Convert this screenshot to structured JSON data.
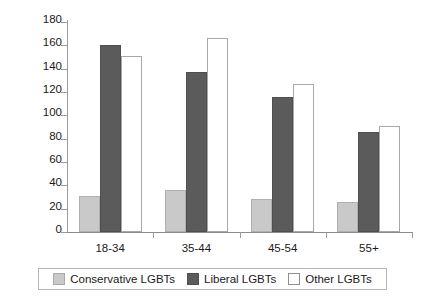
{
  "chart_data": {
    "type": "bar",
    "title": "",
    "subtitle": "",
    "xlabel": "",
    "ylabel": "",
    "categories": [
      "18-34",
      "35-44",
      "45-54",
      "55+"
    ],
    "series": [
      {
        "name": "Conservative LGBTs",
        "color": "#c9c9c9",
        "values": [
          31,
          36,
          28,
          26
        ]
      },
      {
        "name": "Liberal LGBTs",
        "color": "#5b5b5b",
        "values": [
          160,
          137,
          116,
          86
        ]
      },
      {
        "name": "Other LGBTs",
        "color": "#ffffff",
        "values": [
          151,
          166,
          127,
          91
        ]
      }
    ],
    "ylim": [
      0,
      180
    ],
    "ytick_values": [
      0,
      20,
      40,
      60,
      80,
      100,
      120,
      140,
      160,
      180
    ],
    "ytick_labels": [
      "0",
      "20",
      "40",
      "60",
      "80",
      "100",
      "120",
      "140",
      "160",
      "180"
    ],
    "grid": false,
    "legend_position": "bottom",
    "legend_entries": [
      "Conservative LGBTs",
      "Liberal LGBTs",
      "Other LGBTs"
    ]
  },
  "axis": {
    "y_line_color": "#9a9a9a",
    "x_line_color": "#8c8c8c"
  }
}
